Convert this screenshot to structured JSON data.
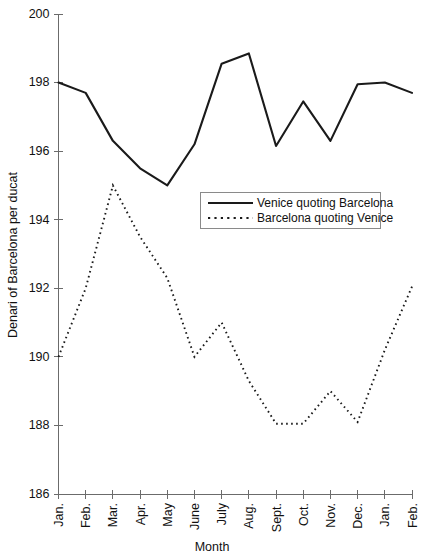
{
  "chart_data": {
    "type": "line",
    "title": "",
    "xlabel": "Month",
    "ylabel": "Denari of Barcelona per ducat",
    "grid": false,
    "legend_position": "center-right-inside",
    "ylim": [
      186,
      200
    ],
    "ytick_values": [
      200,
      198,
      196,
      194,
      192,
      190,
      188,
      186
    ],
    "ytick_labels": [
      "200",
      "198",
      "196",
      "194",
      "192",
      "190",
      "188",
      "186"
    ],
    "categories": [
      "Jan.",
      "Feb.",
      "Mar.",
      "Apr.",
      "May",
      "June",
      "July",
      "Aug.",
      "Sept.",
      "Oct.",
      "Nov.",
      "Dec.",
      "Jan.",
      "Feb."
    ],
    "series": [
      {
        "name": "Venice quoting Barcelona",
        "style": "solid",
        "color": "#1a1a1a",
        "values": [
          198.0,
          197.7,
          196.3,
          195.5,
          195.0,
          196.2,
          198.55,
          198.85,
          196.15,
          197.45,
          196.3,
          197.95,
          198.0,
          197.7
        ]
      },
      {
        "name": "Barcelona quoting Venice",
        "style": "dotted",
        "color": "#1a1a1a",
        "values": [
          190.0,
          192.0,
          195.0,
          193.5,
          192.3,
          190.0,
          191.0,
          189.3,
          188.05,
          188.05,
          189.0,
          188.1,
          190.2,
          192.05
        ]
      }
    ]
  },
  "legend": {
    "entries": [
      {
        "label": "Venice quoting Barcelona",
        "style": "solid"
      },
      {
        "label": "Barcelona quoting Venice",
        "style": "dotted"
      }
    ]
  },
  "axes": {
    "y_title": "Denari of Barcelona per ducat",
    "x_title": "Month"
  }
}
